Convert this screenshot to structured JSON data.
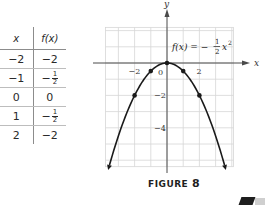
{
  "table": {
    "headers": {
      "x": "x",
      "fx": "f(x)"
    },
    "rows": [
      {
        "x": "−2",
        "fx_sign": "−",
        "fx_whole": "2",
        "fx_num": "",
        "fx_den": ""
      },
      {
        "x": "−1",
        "fx_sign": "−",
        "fx_whole": "",
        "fx_num": "1",
        "fx_den": "2"
      },
      {
        "x": "0",
        "fx_sign": "",
        "fx_whole": "0",
        "fx_num": "",
        "fx_den": ""
      },
      {
        "x": "1",
        "fx_sign": "−",
        "fx_whole": "",
        "fx_num": "1",
        "fx_den": "2"
      },
      {
        "x": "2",
        "fx_sign": "−",
        "fx_whole": "2",
        "fx_num": "",
        "fx_den": ""
      }
    ]
  },
  "graph": {
    "equation_prefix": "f(x) = −",
    "equation_num": "1",
    "equation_den": "2",
    "equation_var": "x",
    "equation_exp": "2",
    "x_axis_label": "x",
    "y_axis_label": "y",
    "x_tick_labels": [
      "−2",
      "0",
      "2"
    ],
    "y_tick_labels": [
      "−2",
      "−4"
    ],
    "plotted_points": [
      [
        -2,
        -2
      ],
      [
        -1,
        -0.5
      ],
      [
        0,
        0
      ],
      [
        1,
        -0.5
      ],
      [
        2,
        -2
      ]
    ],
    "colors": {
      "curve": "#1a1a1a",
      "grid": "#d6d6d6",
      "axis": "#4a4a4a"
    }
  },
  "caption": {
    "label": "FIGURE",
    "number": "8"
  }
}
